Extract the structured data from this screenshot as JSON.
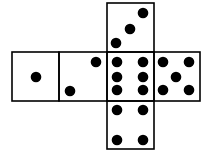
{
  "diagram": {
    "type": "cube-net",
    "stroke_color": "#000000",
    "dot_color": "#000000",
    "background": "#ffffff",
    "faces": [
      {
        "id": "top",
        "pips": 3,
        "x": 107,
        "y": 3,
        "w": 47,
        "h": 49,
        "dots": [
          [
            143,
            13
          ],
          [
            130,
            29
          ],
          [
            116,
            43
          ]
        ]
      },
      {
        "id": "left",
        "pips": 1,
        "x": 12,
        "y": 52,
        "w": 47,
        "h": 49,
        "dots": [
          [
            36,
            77
          ]
        ]
      },
      {
        "id": "middle-left",
        "pips": 2,
        "x": 59,
        "y": 52,
        "w": 48,
        "h": 49,
        "dots": [
          [
            96,
            62
          ],
          [
            70,
            91
          ]
        ]
      },
      {
        "id": "center",
        "pips": 6,
        "x": 107,
        "y": 52,
        "w": 47,
        "h": 49,
        "dots": [
          [
            117,
            62
          ],
          [
            143,
            62
          ],
          [
            117,
            77
          ],
          [
            143,
            77
          ],
          [
            117,
            90
          ],
          [
            143,
            90
          ]
        ]
      },
      {
        "id": "right",
        "pips": 5,
        "x": 154,
        "y": 52,
        "w": 46,
        "h": 49,
        "dots": [
          [
            163,
            62
          ],
          [
            189,
            62
          ],
          [
            176,
            77
          ],
          [
            163,
            90
          ],
          [
            189,
            90
          ]
        ]
      },
      {
        "id": "bottom",
        "pips": 4,
        "x": 107,
        "y": 101,
        "w": 47,
        "h": 48,
        "dots": [
          [
            117,
            110
          ],
          [
            143,
            110
          ],
          [
            117,
            140
          ],
          [
            143,
            140
          ]
        ]
      }
    ]
  }
}
